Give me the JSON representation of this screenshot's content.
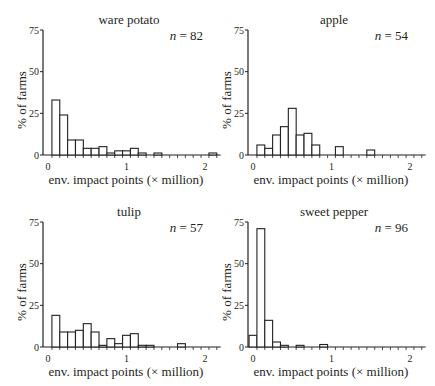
{
  "chart_data": [
    {
      "type": "bar",
      "title": "ware potato",
      "n_label": "n = 82",
      "n_italic": "n",
      "n_value": "= 82",
      "xlabel": "env. impact points (× million)",
      "ylabel": "% of farms",
      "ylim": [
        0,
        75
      ],
      "yticks": [
        0,
        25,
        50,
        75
      ],
      "xlim": [
        0,
        2.2
      ],
      "xticks": [
        0,
        1,
        2
      ],
      "bin_width": 0.1,
      "bin_centers": [
        0.1,
        0.2,
        0.3,
        0.4,
        0.5,
        0.6,
        0.7,
        0.8,
        0.9,
        1.0,
        1.1,
        1.2,
        1.3,
        1.4,
        1.5,
        1.6,
        1.7,
        1.8,
        1.9,
        2.0,
        2.1
      ],
      "values": [
        33,
        24,
        9,
        9,
        4,
        4,
        5,
        1.2,
        2.5,
        2.5,
        4,
        1.2,
        0,
        1.2,
        0,
        0,
        0,
        0,
        0,
        0,
        1.2
      ]
    },
    {
      "type": "bar",
      "title": "apple",
      "n_label": "n = 54",
      "n_italic": "n",
      "n_value": "= 54",
      "xlabel": "env. impact points (× million)",
      "ylabel": "% of farms",
      "ylim": [
        0,
        75
      ],
      "yticks": [
        0,
        25,
        50,
        75
      ],
      "xlim": [
        0,
        2.2
      ],
      "xticks": [
        0,
        1,
        2
      ],
      "bin_width": 0.1,
      "bin_centers": [
        0.1,
        0.2,
        0.3,
        0.4,
        0.5,
        0.6,
        0.7,
        0.8,
        0.9,
        1.0,
        1.1,
        1.2,
        1.3,
        1.4,
        1.5
      ],
      "values": [
        6,
        4,
        12,
        17,
        28,
        12,
        13,
        6,
        0,
        0,
        5,
        0,
        0,
        0,
        3
      ]
    },
    {
      "type": "bar",
      "title": "tulip",
      "n_label": "n = 57",
      "n_italic": "n",
      "n_value": "= 57",
      "xlabel": "env. impact points (× million)",
      "ylabel": "% of farms",
      "ylim": [
        0,
        75
      ],
      "yticks": [
        0,
        25,
        50,
        75
      ],
      "xlim": [
        0,
        2.2
      ],
      "xticks": [
        0,
        1,
        2
      ],
      "bin_width": 0.1,
      "bin_centers": [
        0.1,
        0.2,
        0.3,
        0.4,
        0.5,
        0.6,
        0.7,
        0.8,
        0.9,
        1.0,
        1.1,
        1.2,
        1.3,
        1.4,
        1.5,
        1.6,
        1.7
      ],
      "values": [
        19,
        9,
        9,
        10,
        14,
        9,
        1,
        5,
        2,
        7,
        8,
        1,
        1,
        0,
        0,
        0,
        2
      ]
    },
    {
      "type": "bar",
      "title": "sweet pepper",
      "n_label": "n = 96",
      "n_italic": "n",
      "n_value": "= 96",
      "xlabel": "env. impact points (× million)",
      "ylabel": "% of farms",
      "ylim": [
        0,
        75
      ],
      "yticks": [
        0,
        25,
        50,
        75
      ],
      "xlim": [
        0,
        2.2
      ],
      "xticks": [
        0,
        1,
        2
      ],
      "bin_width": 0.1,
      "bin_centers": [
        0.0,
        0.1,
        0.2,
        0.3,
        0.4,
        0.5,
        0.6,
        0.7,
        0.8,
        0.9
      ],
      "values": [
        7,
        71,
        16,
        3,
        1,
        0,
        1,
        0,
        0,
        1.5
      ]
    }
  ],
  "panels": [
    {
      "title": "ware potato",
      "n_italic": "n",
      "n_value": " = 82"
    },
    {
      "title": "apple",
      "n_italic": "n",
      "n_value": " = 54"
    },
    {
      "title": "tulip",
      "n_italic": "n",
      "n_value": " = 57"
    },
    {
      "title": "sweet pepper",
      "n_italic": "n",
      "n_value": " = 96"
    }
  ],
  "axis_text": {
    "xlabel": "env. impact points (× million)",
    "ylabel": "% of farms",
    "yticks": [
      "0",
      "25",
      "50",
      "75"
    ],
    "xticks": [
      "0",
      "1",
      "2"
    ]
  },
  "colors": {
    "bar_fill": "#ffffff",
    "stroke": "#231f20"
  }
}
